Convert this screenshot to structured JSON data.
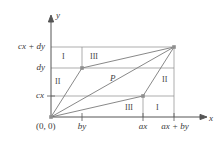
{
  "figure": {
    "axes": {
      "x_label": "x",
      "y_label": "y",
      "origin_label": "(0, 0)"
    },
    "y_ticks": [
      {
        "id": "cx-plus-dy",
        "label": "cx + dy"
      },
      {
        "id": "dy",
        "label": "dy"
      },
      {
        "id": "cx",
        "label": "cx"
      }
    ],
    "x_ticks": [
      {
        "id": "by",
        "label": "by"
      },
      {
        "id": "ax",
        "label": "ax"
      },
      {
        "id": "ax-plus-by",
        "label": "ax + by"
      }
    ],
    "regions": [
      {
        "id": "top-left-I",
        "label": "I"
      },
      {
        "id": "top-right-III",
        "label": "III"
      },
      {
        "id": "left-II",
        "label": "II"
      },
      {
        "id": "center-P",
        "label": "P"
      },
      {
        "id": "right-II",
        "label": "II"
      },
      {
        "id": "bottom-III",
        "label": "III"
      },
      {
        "id": "bottom-right-I",
        "label": "I"
      }
    ],
    "colors": {
      "axis": "#555555",
      "grid": "#8a8a8a",
      "shape": "#7a7a7a",
      "text": "#3a3a3a",
      "vertex": "#8f8f8f",
      "background": "#ffffff"
    }
  }
}
